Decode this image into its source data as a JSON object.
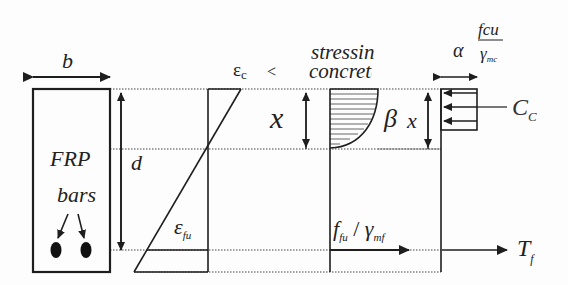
{
  "diagram": {
    "section": {
      "width_label": "b",
      "depth_label": "d",
      "material_label": "FRP",
      "bars_label": "bars",
      "bar_count": 2
    },
    "strain": {
      "top_label": "ε",
      "top_sub": "c",
      "top_suffix": "<",
      "bottom_label": "ε",
      "bottom_sub": "fu"
    },
    "neutral_axis": {
      "label": "x"
    },
    "stress": {
      "heading_line1": "stressin",
      "heading_line2": "concrete",
      "beta_label": "β",
      "x_label": "x",
      "steel_stress_label": "f",
      "steel_stress_sub": "fu",
      "steel_stress_div": "/",
      "steel_gamma": "γ",
      "steel_gamma_sub": "mf"
    },
    "block": {
      "alpha": "α",
      "numerator": "fcu",
      "denominator": "γ",
      "denominator_sub": "mc",
      "compression_label": "C",
      "compression_sub": "C",
      "tension_label": "T",
      "tension_sub": "f"
    },
    "colors": {
      "line": "#1e1e1e",
      "dotted": "#444444",
      "hatch": "#555555",
      "text": "#222222"
    }
  }
}
